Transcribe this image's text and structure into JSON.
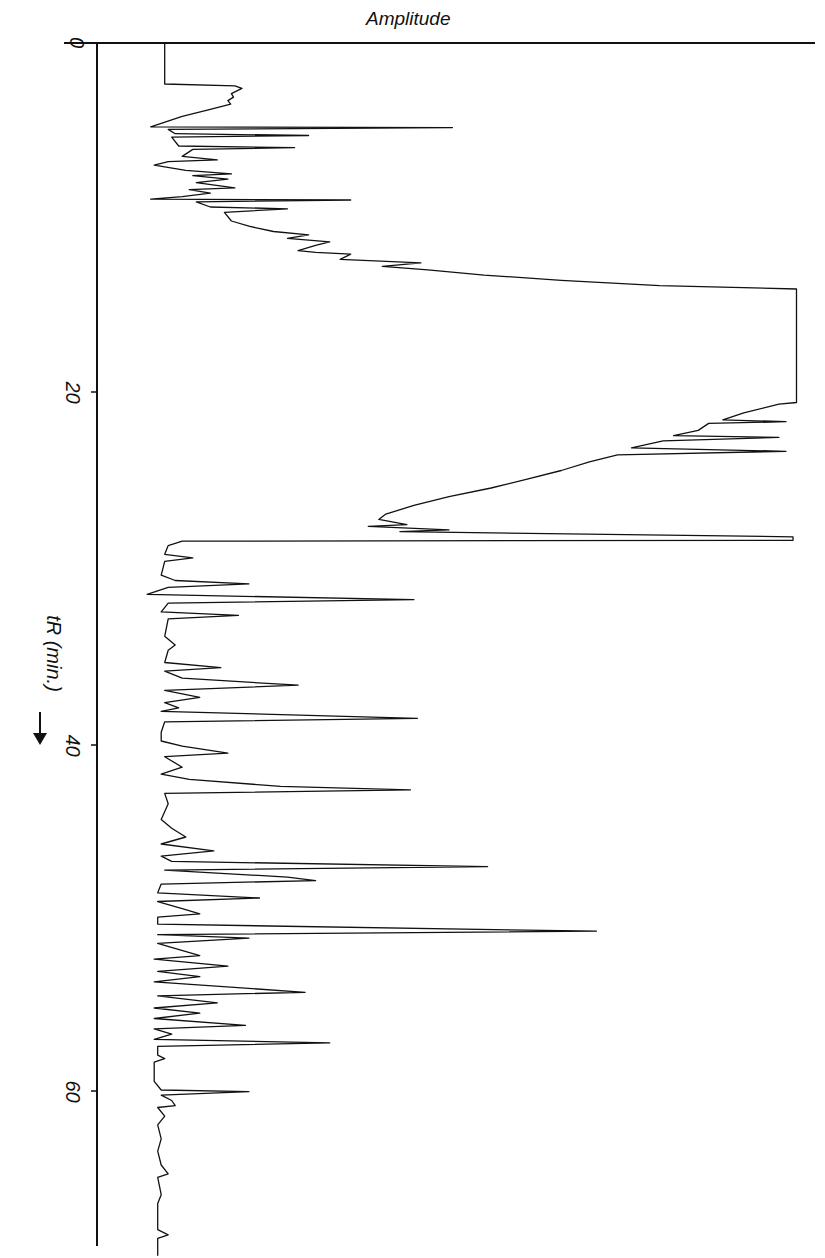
{
  "chart_data": {
    "type": "line",
    "title": "Amplitude",
    "xlabel": "Amplitude",
    "ylabel": "tR (min.)",
    "ylabel_arrow": "down-arrow",
    "orientation": "time axis vertical (downward), amplitude horizontal (rightward)",
    "time_ticks": [
      0,
      20,
      40,
      60
    ],
    "time_tick_labels": [
      "0",
      "20",
      "40",
      "60"
    ],
    "time_range": [
      0,
      69.5
    ],
    "amplitude_range": [
      0,
      100
    ],
    "amplitude_unit": "relative % of full scale (no ticks shown)",
    "grid": false,
    "legend": null,
    "series": [
      {
        "name": "chromatogram",
        "points": [
          [
            0.0,
            9.5
          ],
          [
            2.3,
            9.5
          ],
          [
            2.35,
            9.5
          ],
          [
            2.45,
            19.5
          ],
          [
            2.6,
            20.5
          ],
          [
            2.9,
            19.0
          ],
          [
            3.1,
            19.3
          ],
          [
            3.3,
            18.5
          ],
          [
            3.5,
            18.9
          ],
          [
            3.8,
            16.0
          ],
          [
            4.2,
            12.0
          ],
          [
            4.6,
            9.0
          ],
          [
            4.8,
            7.5
          ],
          [
            4.85,
            50.5
          ],
          [
            4.95,
            10.0
          ],
          [
            5.2,
            11.0
          ],
          [
            5.3,
            30.0
          ],
          [
            5.4,
            10.5
          ],
          [
            5.9,
            11.5
          ],
          [
            6.0,
            28.0
          ],
          [
            6.1,
            13.5
          ],
          [
            6.5,
            12.0
          ],
          [
            6.7,
            17.0
          ],
          [
            6.8,
            10.0
          ],
          [
            7.0,
            8.0
          ],
          [
            7.3,
            12.5
          ],
          [
            7.5,
            19.0
          ],
          [
            7.6,
            13.5
          ],
          [
            7.8,
            18.5
          ],
          [
            8.0,
            14.0
          ],
          [
            8.3,
            19.5
          ],
          [
            8.4,
            13.0
          ],
          [
            8.6,
            16.0
          ],
          [
            8.8,
            12.0
          ],
          [
            8.95,
            7.5
          ],
          [
            9.0,
            36.0
          ],
          [
            9.1,
            14.0
          ],
          [
            9.4,
            16.0
          ],
          [
            9.5,
            27.0
          ],
          [
            9.7,
            18.0
          ],
          [
            10.2,
            19.0
          ],
          [
            10.5,
            21.5
          ],
          [
            10.8,
            25.0
          ],
          [
            11.0,
            30.0
          ],
          [
            11.2,
            27.0
          ],
          [
            11.4,
            33.0
          ],
          [
            11.6,
            31.0
          ],
          [
            11.9,
            28.5
          ],
          [
            12.0,
            31.0
          ],
          [
            12.1,
            36.0
          ],
          [
            12.4,
            34.5
          ],
          [
            12.6,
            46.0
          ],
          [
            12.8,
            40.5
          ],
          [
            13.0,
            47.0
          ],
          [
            13.3,
            55.0
          ],
          [
            13.6,
            66.0
          ],
          [
            13.9,
            80.0
          ],
          [
            14.1,
            99.5
          ],
          [
            17.0,
            99.5
          ],
          [
            20.6,
            99.5
          ],
          [
            20.7,
            97.0
          ],
          [
            21.2,
            92.0
          ],
          [
            21.6,
            89.0
          ],
          [
            21.7,
            98.0
          ],
          [
            21.8,
            87.0
          ],
          [
            22.2,
            85.5
          ],
          [
            22.5,
            82.0
          ],
          [
            22.6,
            97.0
          ],
          [
            22.8,
            80.5
          ],
          [
            23.2,
            76.0
          ],
          [
            23.4,
            98.0
          ],
          [
            23.6,
            74.0
          ],
          [
            24.0,
            70.0
          ],
          [
            24.5,
            66.0
          ],
          [
            25.0,
            61.0
          ],
          [
            25.5,
            56.0
          ],
          [
            26.0,
            50.0
          ],
          [
            26.5,
            45.0
          ],
          [
            27.0,
            41.0
          ],
          [
            27.3,
            40.0
          ],
          [
            27.6,
            44.0
          ],
          [
            27.7,
            38.5
          ],
          [
            27.9,
            50.0
          ],
          [
            28.0,
            43.0
          ],
          [
            28.3,
            99.0
          ],
          [
            28.5,
            99.0
          ],
          [
            28.55,
            12.0
          ],
          [
            28.8,
            10.0
          ],
          [
            29.3,
            9.5
          ],
          [
            29.5,
            13.5
          ],
          [
            29.7,
            9.5
          ],
          [
            30.5,
            9.0
          ],
          [
            30.8,
            11.0
          ],
          [
            31.0,
            21.5
          ],
          [
            31.2,
            10.0
          ],
          [
            31.6,
            7.0
          ],
          [
            31.9,
            45.0
          ],
          [
            32.1,
            10.0
          ],
          [
            32.6,
            9.0
          ],
          [
            32.8,
            20.0
          ],
          [
            33.0,
            10.0
          ],
          [
            34.0,
            9.5
          ],
          [
            34.5,
            11.0
          ],
          [
            34.8,
            10.0
          ],
          [
            35.5,
            9.5
          ],
          [
            35.8,
            17.5
          ],
          [
            36.0,
            9.5
          ],
          [
            36.4,
            12.0
          ],
          [
            36.8,
            28.5
          ],
          [
            37.1,
            9.5
          ],
          [
            37.5,
            14.5
          ],
          [
            37.8,
            9.5
          ],
          [
            38.1,
            11.5
          ],
          [
            38.3,
            9.0
          ],
          [
            38.7,
            45.5
          ],
          [
            38.9,
            9.5
          ],
          [
            39.5,
            9.0
          ],
          [
            40.0,
            9.0
          ],
          [
            40.3,
            12.0
          ],
          [
            40.7,
            18.5
          ],
          [
            40.9,
            9.5
          ],
          [
            41.5,
            12.0
          ],
          [
            41.9,
            9.0
          ],
          [
            42.2,
            13.0
          ],
          [
            42.6,
            26.0
          ],
          [
            42.8,
            44.5
          ],
          [
            43.0,
            9.5
          ],
          [
            43.6,
            10.0
          ],
          [
            44.5,
            9.0
          ],
          [
            45.0,
            10.5
          ],
          [
            45.5,
            12.5
          ],
          [
            45.9,
            9.0
          ],
          [
            46.3,
            16.5
          ],
          [
            46.6,
            9.0
          ],
          [
            46.9,
            10.5
          ],
          [
            47.2,
            55.5
          ],
          [
            47.4,
            9.5
          ],
          [
            47.8,
            27.0
          ],
          [
            48.0,
            31.0
          ],
          [
            48.2,
            9.0
          ],
          [
            48.7,
            8.5
          ],
          [
            49.0,
            23.0
          ],
          [
            49.2,
            8.5
          ],
          [
            49.6,
            12.0
          ],
          [
            49.9,
            14.5
          ],
          [
            50.1,
            8.5
          ],
          [
            50.5,
            8.5
          ],
          [
            50.9,
            71.0
          ],
          [
            51.1,
            8.5
          ],
          [
            51.3,
            21.5
          ],
          [
            51.6,
            8.5
          ],
          [
            52.3,
            14.5
          ],
          [
            52.5,
            8.0
          ],
          [
            52.9,
            18.5
          ],
          [
            53.2,
            8.5
          ],
          [
            53.5,
            14.5
          ],
          [
            53.8,
            8.0
          ],
          [
            54.4,
            29.5
          ],
          [
            54.6,
            8.5
          ],
          [
            55.0,
            17.0
          ],
          [
            55.3,
            8.0
          ],
          [
            55.6,
            14.5
          ],
          [
            55.9,
            8.0
          ],
          [
            56.3,
            21.0
          ],
          [
            56.5,
            8.0
          ],
          [
            56.8,
            10.5
          ],
          [
            57.1,
            8.0
          ],
          [
            57.3,
            33.0
          ],
          [
            57.5,
            8.5
          ],
          [
            58.0,
            8.5
          ],
          [
            58.2,
            9.5
          ],
          [
            58.4,
            8.0
          ],
          [
            59.0,
            8.0
          ],
          [
            59.5,
            8.0
          ],
          [
            60.0,
            9.0
          ],
          [
            60.1,
            21.5
          ],
          [
            60.3,
            9.0
          ],
          [
            60.6,
            10.5
          ],
          [
            60.9,
            11.0
          ],
          [
            61.0,
            8.5
          ],
          [
            61.5,
            9.5
          ],
          [
            62.0,
            8.5
          ],
          [
            62.8,
            9.0
          ],
          [
            63.5,
            8.5
          ],
          [
            64.3,
            9.0
          ],
          [
            64.8,
            10.0
          ],
          [
            65.0,
            8.5
          ],
          [
            66.0,
            9.0
          ],
          [
            66.5,
            8.5
          ],
          [
            67.0,
            8.5
          ],
          [
            67.5,
            8.5
          ],
          [
            68.0,
            8.5
          ],
          [
            68.3,
            10.0
          ],
          [
            68.5,
            8.5
          ],
          [
            69.0,
            8.5
          ],
          [
            69.5,
            8.5
          ]
        ]
      }
    ],
    "notable_peaks": [
      {
        "t": 4.85,
        "amplitude": 50.5
      },
      {
        "t": 9.0,
        "amplitude": 36.0
      },
      {
        "t": 14.1,
        "amplitude": 99.5,
        "note": "broad saturated band 14.1-20.6 min"
      },
      {
        "t": 28.3,
        "amplitude": 99.0
      },
      {
        "t": 31.9,
        "amplitude": 45.0
      },
      {
        "t": 38.7,
        "amplitude": 45.5
      },
      {
        "t": 42.8,
        "amplitude": 44.5
      },
      {
        "t": 47.2,
        "amplitude": 55.5
      },
      {
        "t": 50.9,
        "amplitude": 71.0
      },
      {
        "t": 54.4,
        "amplitude": 29.5
      },
      {
        "t": 57.3,
        "amplitude": 33.0
      },
      {
        "t": 60.1,
        "amplitude": 21.5
      }
    ]
  },
  "labels": {
    "title": "Amplitude",
    "ylabel": "tR (min.)",
    "ticks": [
      "0",
      "20",
      "40",
      "60"
    ]
  }
}
